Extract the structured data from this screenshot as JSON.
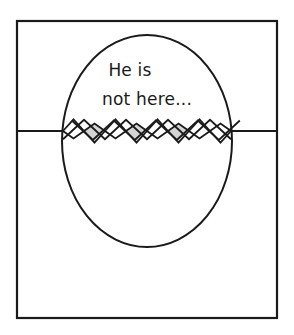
{
  "scene": {
    "title": "Easter egg greeting card illustration",
    "background_color": "#ffffff",
    "width": 294,
    "height": 335
  },
  "card": {
    "name": "greeting-card",
    "frame": {
      "x": 17,
      "y": 21,
      "width": 260,
      "height": 297,
      "stroke_color": "#1a1a1a",
      "stroke_width": 2.2,
      "fill_color": "#ffffff"
    },
    "fold_line": {
      "y": 131,
      "x_start": 17,
      "x_end": 277,
      "stroke_color": "#1a1a1a",
      "stroke_width": 2.2
    }
  },
  "egg": {
    "name": "cracked-egg",
    "center_x": 147,
    "center_y": 141,
    "radius_x": 85,
    "radius_y": 106,
    "stroke_color": "#1a1a1a",
    "stroke_width": 2.0,
    "fill_color": "#ffffff"
  },
  "message": {
    "line1": "He is",
    "line2": "not here...",
    "color": "#1a1a1a",
    "line1_x": 130,
    "line1_y": 76,
    "line2_x": 147,
    "line2_y": 105
  },
  "crack": {
    "name": "eggshell-crack",
    "center_y": 131,
    "amplitude": 15,
    "x_start": 63,
    "x_end": 231,
    "segments": 8,
    "shell_fill_gray": "#d4d4d4",
    "shell_fill_white": "#ffffff",
    "stroke_color": "#1a1a1a",
    "stroke_width": 1.8,
    "diamond_fills": [
      "#ffffff",
      "#d4d4d4",
      "#ffffff",
      "#d4d4d4",
      "#ffffff",
      "#d4d4d4",
      "#ffffff",
      "#ffffff"
    ]
  }
}
